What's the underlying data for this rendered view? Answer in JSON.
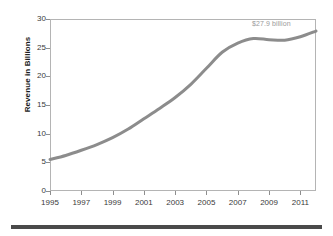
{
  "chart_data": {
    "type": "line",
    "title": "",
    "subtitle": "",
    "xlabel": "",
    "ylabel": "Revenue in Billions",
    "xlim": [
      1995,
      2012
    ],
    "ylim": [
      0,
      30
    ],
    "grid": false,
    "legend": null,
    "line_color": "#8c8c8c",
    "line_width": 3,
    "x": [
      1995,
      1996,
      1997,
      1998,
      1999,
      2000,
      2001,
      2002,
      2003,
      2004,
      2005,
      2006,
      2007,
      2008,
      2009,
      2010,
      2011,
      2012
    ],
    "values": [
      5.5,
      6.2,
      7.1,
      8.1,
      9.3,
      10.8,
      12.6,
      14.4,
      16.3,
      18.6,
      21.4,
      24.2,
      25.8,
      26.6,
      26.4,
      26.3,
      26.9,
      27.9
    ],
    "series": [
      {
        "name": "Revenue",
        "values": [
          5.5,
          6.2,
          7.1,
          8.1,
          9.3,
          10.8,
          12.6,
          14.4,
          16.3,
          18.6,
          21.4,
          24.2,
          25.8,
          26.6,
          26.4,
          26.3,
          26.9,
          27.9
        ]
      }
    ],
    "ytick_labels": [
      "0",
      "5",
      "10",
      "15",
      "20",
      "25",
      "30"
    ],
    "ytick_values": [
      0,
      5,
      10,
      15,
      20,
      25,
      30
    ],
    "xtick_labels": [
      "1995",
      "1997",
      "1999",
      "2001",
      "2003",
      "2005",
      "2007",
      "2009",
      "2011"
    ],
    "xtick_values": [
      1995,
      1997,
      1999,
      2001,
      2003,
      2005,
      2007,
      2009,
      2011
    ],
    "annotations": [
      {
        "text": "$27.9 billion",
        "x": 2012,
        "y": 27.9,
        "color": "#9a9a9a"
      }
    ]
  },
  "annotation": {
    "endpoint_label": "$27.9 billion"
  },
  "axes": {
    "y_title": "Revenue in Billions"
  },
  "footer": {
    "rule_color": "#4a4a4a"
  }
}
